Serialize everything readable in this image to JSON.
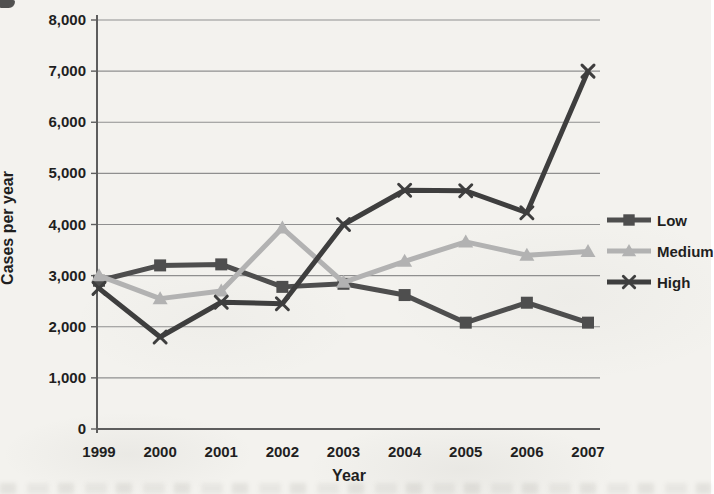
{
  "page": {
    "background_color": "#f3f2ee",
    "artifacts": [
      "top-left-corner-smudge",
      "bottom-bleed-through-noise"
    ]
  },
  "chart_data": {
    "type": "line",
    "title": "",
    "xlabel": "Year",
    "ylabel": "Cases per year",
    "x": [
      "1999",
      "2000",
      "2001",
      "2002",
      "2003",
      "2004",
      "2005",
      "2006",
      "2007"
    ],
    "series": [
      {
        "name": "Low",
        "marker": "square",
        "color": "#4e4e4e",
        "values": [
          2900,
          3200,
          3220,
          2780,
          2840,
          2620,
          2080,
          2470,
          2080
        ]
      },
      {
        "name": "Medium",
        "marker": "triangle",
        "color": "#b2b2b2",
        "values": [
          3000,
          2550,
          2700,
          3930,
          2870,
          3280,
          3660,
          3400,
          3470
        ]
      },
      {
        "name": "High",
        "marker": "x",
        "color": "#3e3e3e",
        "values": [
          2750,
          1800,
          2480,
          2450,
          4000,
          4670,
          4660,
          4230,
          7000
        ]
      }
    ],
    "ylim": [
      0,
      8000
    ],
    "ytick_step": 1000,
    "ytick_labels": [
      "0",
      "1,000",
      "2,000",
      "3,000",
      "4,000",
      "5,000",
      "6,000",
      "7,000",
      "8,000"
    ],
    "grid": "horizontal",
    "legend_position": "right",
    "colors": {
      "grid": "#8f8f8f",
      "axis": "#5d5d5d",
      "text": "#1f1f1f"
    }
  }
}
